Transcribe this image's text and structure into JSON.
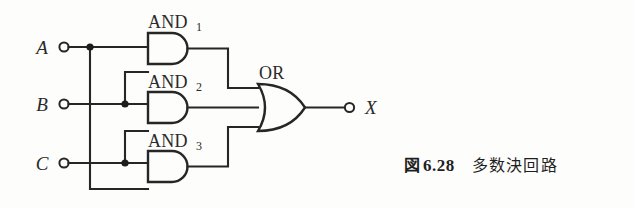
{
  "figure": {
    "caption_fig_word": "図",
    "caption_number": "6.28",
    "caption_title": "多数決回路"
  },
  "colors": {
    "ink": "#262626",
    "paper": "#fdfdfb",
    "junction": "#1d1d1d"
  },
  "ports": {
    "inputs": [
      {
        "label": "A",
        "name": "input-terminal-a"
      },
      {
        "label": "B",
        "name": "input-terminal-b"
      },
      {
        "label": "C",
        "name": "input-terminal-c"
      }
    ],
    "outputs": [
      {
        "label": "X",
        "name": "output-terminal-x"
      }
    ]
  },
  "gates": [
    {
      "name": "and-gate-1",
      "label": "AND",
      "subscript": "1",
      "type": "AND",
      "inputs": [
        "A",
        "B"
      ]
    },
    {
      "name": "and-gate-2",
      "label": "AND",
      "subscript": "2",
      "type": "AND",
      "inputs": [
        "B",
        "C"
      ]
    },
    {
      "name": "and-gate-3",
      "label": "AND",
      "subscript": "3",
      "type": "AND",
      "inputs": [
        "C",
        "A"
      ]
    },
    {
      "name": "or-gate",
      "label": "OR",
      "subscript": "",
      "type": "OR",
      "inputs": [
        "AND1",
        "AND2",
        "AND3"
      ]
    }
  ],
  "circuit": {
    "expression": "X = A·B + B·C + C·A",
    "junction_count": 3
  }
}
